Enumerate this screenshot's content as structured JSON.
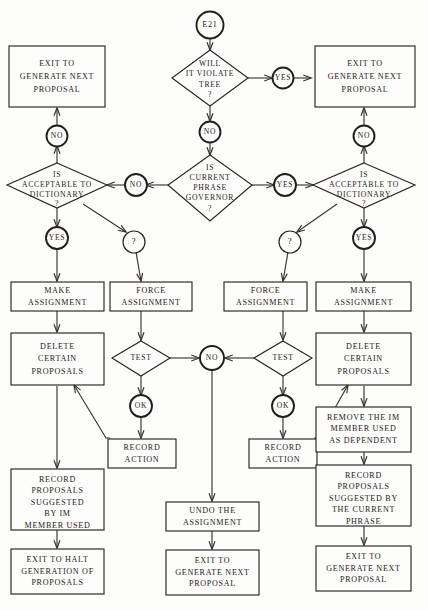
{
  "diagram": {
    "type": "flowchart",
    "canvas": {
      "width": 428,
      "height": 610
    },
    "colors": {
      "ink": "#1d1a17",
      "line": "#3a3530",
      "paper": "#fdfdfb"
    }
  },
  "nodes": {
    "start": {
      "label": "E21",
      "shape": "circle"
    },
    "d_violate_tree": {
      "label_lines": [
        "WILL",
        "IT VIOLATE",
        "TREE",
        "?"
      ],
      "shape": "diamond"
    },
    "c_tree_yes": {
      "label": "YES",
      "shape": "circle"
    },
    "c_tree_no": {
      "label": "NO",
      "shape": "circle"
    },
    "b_exit_gen_tl": {
      "label_lines": [
        "EXIT TO",
        "GENERATE NEXT",
        "PROPOSAL"
      ],
      "shape": "box"
    },
    "b_exit_gen_tr": {
      "label_lines": [
        "EXIT TO",
        "GENERATE NEXT",
        "PROPOSAL"
      ],
      "shape": "box"
    },
    "c_left_no_top": {
      "label": "NO",
      "shape": "circle"
    },
    "c_right_no_top": {
      "label": "NO",
      "shape": "circle"
    },
    "d_gov": {
      "label_lines": [
        "IS",
        "CURRENT",
        "PHRASE",
        "GOVERNOR",
        "?"
      ],
      "shape": "diamond"
    },
    "c_gov_no": {
      "label": "NO",
      "shape": "circle"
    },
    "c_gov_yes": {
      "label": "YES",
      "shape": "circle"
    },
    "d_dict_left": {
      "label_lines": [
        "IS",
        "ACCEPTABLE TO",
        "DICTIONARY",
        "?"
      ],
      "shape": "diamond"
    },
    "d_dict_right": {
      "label_lines": [
        "IS",
        "ACCEPTABLE TO",
        "DICTIONARY",
        "?"
      ],
      "shape": "diamond"
    },
    "c_dict_left_yes": {
      "label": "YES",
      "shape": "circle"
    },
    "c_dict_left_q": {
      "label": "?",
      "shape": "circle"
    },
    "c_dict_right_q": {
      "label": "?",
      "shape": "circle"
    },
    "c_dict_right_yes": {
      "label": "YES",
      "shape": "circle"
    },
    "b_make_assign_l": {
      "label_lines": [
        "MAKE",
        "ASSIGNMENT"
      ],
      "shape": "box"
    },
    "b_force_assign_l": {
      "label_lines": [
        "FORCE",
        "ASSIGNMENT"
      ],
      "shape": "box"
    },
    "b_force_assign_r": {
      "label_lines": [
        "FORCE",
        "ASSIGNMENT"
      ],
      "shape": "box"
    },
    "b_make_assign_r": {
      "label_lines": [
        "MAKE",
        "ASSIGNMENT"
      ],
      "shape": "box"
    },
    "b_delete_l": {
      "label_lines": [
        "DELETE",
        "CERTAIN",
        "PROPOSALS"
      ],
      "shape": "box"
    },
    "b_delete_r": {
      "label_lines": [
        "DELETE",
        "CERTAIN",
        "PROPOSALS"
      ],
      "shape": "box"
    },
    "d_test_l": {
      "label": "TEST",
      "shape": "diamond"
    },
    "d_test_r": {
      "label": "TEST",
      "shape": "diamond"
    },
    "c_test_no": {
      "label": "NO",
      "shape": "circle"
    },
    "c_ok_l": {
      "label": "OK",
      "shape": "circle"
    },
    "c_ok_r": {
      "label": "OK",
      "shape": "circle"
    },
    "b_record_action_l": {
      "label_lines": [
        "RECORD",
        "ACTION"
      ],
      "shape": "box"
    },
    "b_record_action_r": {
      "label_lines": [
        "RECORD",
        "ACTION"
      ],
      "shape": "box"
    },
    "b_remove_im": {
      "label_lines": [
        "REMOVE THE IM",
        "MEMBER USED",
        "AS DEPENDENT"
      ],
      "shape": "box"
    },
    "b_record_prop_l": {
      "label_lines": [
        "RECORD",
        "PROPOSALS",
        "SUGGESTED",
        "BY IM",
        "MEMBER USED"
      ],
      "shape": "box"
    },
    "b_record_prop_r": {
      "label_lines": [
        "RECORD",
        "PROPOSALS",
        "SUGGESTED BY",
        "THE CURRENT",
        "PHRASE"
      ],
      "shape": "box"
    },
    "b_undo": {
      "label_lines": [
        "UNDO THE",
        "ASSIGNMENT"
      ],
      "shape": "box"
    },
    "b_exit_halt": {
      "label_lines": [
        "EXIT TO HALT",
        "GENERATION OF",
        "PROPOSALS"
      ],
      "shape": "box"
    },
    "b_exit_gen_bm": {
      "label_lines": [
        "EXIT TO",
        "GENERATE NEXT",
        "PROPOSAL"
      ],
      "shape": "box"
    },
    "b_exit_gen_br": {
      "label_lines": [
        "EXIT TO",
        "GENERATE NEXT",
        "PROPOSAL"
      ],
      "shape": "box"
    }
  }
}
